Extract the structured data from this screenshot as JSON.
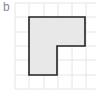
{
  "figure": {
    "label": "b",
    "grid": {
      "origin_x": 15,
      "origin_y": 3,
      "cell_size": 14.3,
      "columns": 6,
      "rows": 6,
      "line_color": "#e4e4e4"
    },
    "shape": {
      "name": "L-shape",
      "fill": "#e8e8e8",
      "stroke": "#222222",
      "points_px": "29,17 85,17 85,46 57,46 57,75 29,75",
      "points_grid": [
        [
          1,
          1
        ],
        [
          5,
          1
        ],
        [
          5,
          3
        ],
        [
          3,
          3
        ],
        [
          3,
          5
        ],
        [
          1,
          5
        ]
      ]
    }
  }
}
